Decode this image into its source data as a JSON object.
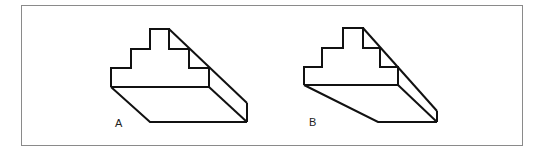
{
  "figure": {
    "frame_color": "#8a8a8a",
    "line_color": "#111111",
    "panels": [
      {
        "label": "A",
        "description": "stepped block on slab with parallel oblique projection",
        "label_pos": [
          115,
          117
        ]
      },
      {
        "label": "B",
        "description": "stepped block on slab with converging oblique bottom edge",
        "label_pos": [
          309,
          116
        ]
      }
    ]
  }
}
